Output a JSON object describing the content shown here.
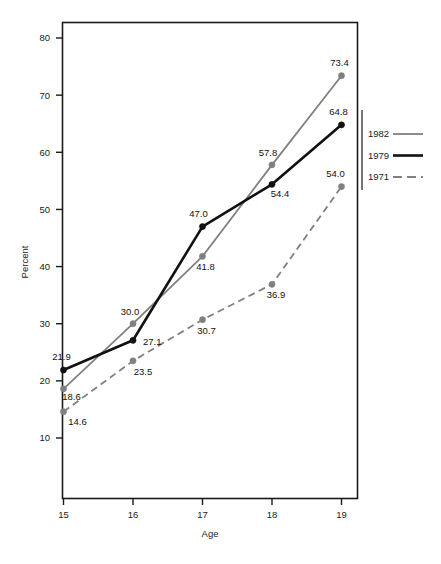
{
  "chart_data": {
    "type": "line",
    "title": "",
    "xlabel": "Age",
    "ylabel": "Percent",
    "x": [
      15,
      16,
      17,
      18,
      19
    ],
    "categories": [
      "15",
      "16",
      "17",
      "18",
      "19"
    ],
    "xtick_labels": [
      "15",
      "16",
      "17",
      "18",
      "19"
    ],
    "ytick_labels": [
      "10",
      "20",
      "30",
      "40",
      "50",
      "60",
      "70",
      "80"
    ],
    "ytick_values": [
      10,
      20,
      30,
      40,
      50,
      60,
      70,
      80
    ],
    "xlim": [
      15,
      19
    ],
    "ylim": [
      3.5,
      84
    ],
    "grid": false,
    "legend_position": "right",
    "series": [
      {
        "name": "1982",
        "color": "#808080",
        "style": "solid",
        "width": 1.8,
        "values": [
          18.6,
          30.0,
          41.8,
          57.8,
          73.4
        ],
        "labels": [
          "18.6",
          "30.0",
          "41.8",
          "57.8",
          "73.4"
        ]
      },
      {
        "name": "1979",
        "color": "#111111",
        "style": "solid",
        "width": 2.6,
        "values": [
          21.9,
          27.1,
          47.0,
          54.4,
          64.8
        ],
        "labels": [
          "21.9",
          "27.1",
          "47.0",
          "54.4",
          "64.8"
        ]
      },
      {
        "name": "1971",
        "color": "#808080",
        "style": "dashed",
        "width": 1.8,
        "values": [
          14.6,
          23.5,
          30.7,
          36.9,
          54.0
        ],
        "labels": [
          "14.6",
          "23.5",
          "30.7",
          "36.9",
          "54.0"
        ]
      }
    ]
  },
  "legend": {
    "entries": [
      {
        "label": "1982"
      },
      {
        "label": "1979"
      },
      {
        "label": "1971"
      }
    ]
  },
  "axes": {
    "x_title": "Age",
    "y_title": "Percent"
  },
  "colors": {
    "gray": "#808080",
    "black": "#111111",
    "frame": "#1a1a1a",
    "background": "#ffffff"
  }
}
